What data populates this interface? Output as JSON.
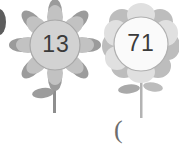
{
  "scene": {
    "title": "Two numbered flowers",
    "background_color": "#ffffff"
  },
  "flowers": [
    {
      "id": "flower-left",
      "number": "13",
      "center_x": 55,
      "center_y": 45,
      "center_radius": 25,
      "center_fill": "#d2d2d2",
      "center_stroke": "#a8a8a8",
      "petal_style": "pointed-and-round",
      "petal_colors": [
        "#9b9b9b",
        "#b4b4b4",
        "#c6c6c6"
      ],
      "stem_color": "#8e8e8e",
      "leaf_color": "#9c9c9c",
      "stem_bottom_y": 113
    },
    {
      "id": "flower-right",
      "number": "71",
      "center_x": 141,
      "center_y": 44,
      "center_radius": 27,
      "center_fill": "#fafafa",
      "center_stroke": "#b0b0b0",
      "petal_style": "round",
      "petal_colors": [
        "#bdbdbd",
        "#d4d4d4",
        "#e2e2e2"
      ],
      "stem_color": "#b3b3b3",
      "leaf_color": "#a9a9a9",
      "stem_bottom_y": 118
    }
  ],
  "edge_petal": {
    "id": "cropped-petal-left-edge",
    "color": "#5d5d5d"
  },
  "marks": {
    "open_paren": "("
  }
}
